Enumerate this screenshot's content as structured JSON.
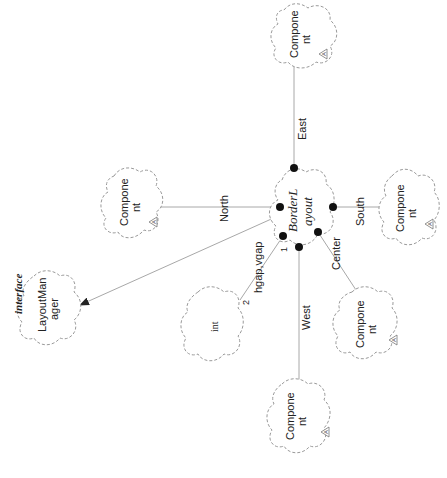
{
  "diagram": {
    "type": "UML class diagram (Booch cloud notation), rotated 90° counter-clockwise",
    "center_class": {
      "name_line1": "BorderL",
      "name_line2": "ayout"
    },
    "classes": [
      {
        "id": "component-east",
        "line1": "Compone",
        "line2": "nt",
        "abstract_marker": "A"
      },
      {
        "id": "component-north",
        "line1": "Compone",
        "line2": "nt",
        "abstract_marker": "A"
      },
      {
        "id": "component-south",
        "line1": "Compone",
        "line2": "nt",
        "abstract_marker": "A"
      },
      {
        "id": "component-center",
        "line1": "Compone",
        "line2": "nt",
        "abstract_marker": "A"
      },
      {
        "id": "component-west",
        "line1": "Compone",
        "line2": "nt",
        "abstract_marker": "A"
      },
      {
        "id": "int",
        "line1": "int"
      },
      {
        "id": "layout-manager",
        "stereotype": "interface",
        "line1": "LayoutMan",
        "line2": "ager"
      }
    ],
    "relations": [
      {
        "label": "East",
        "from": "BorderLayout",
        "to": "component-east",
        "kind": "has"
      },
      {
        "label": "North",
        "from": "BorderLayout",
        "to": "component-north",
        "kind": "has"
      },
      {
        "label": "South",
        "from": "BorderLayout",
        "to": "component-south",
        "kind": "has"
      },
      {
        "label": "Center",
        "from": "BorderLayout",
        "to": "component-center",
        "kind": "has"
      },
      {
        "label": "West",
        "from": "BorderLayout",
        "to": "component-west",
        "kind": "has"
      },
      {
        "label": "hgap,vgap",
        "from": "BorderLayout",
        "to": "int",
        "kind": "has",
        "source_multiplicity": "1",
        "target_multiplicity": "2"
      },
      {
        "label": "",
        "from": "BorderLayout",
        "to": "layout-manager",
        "kind": "realizes"
      }
    ]
  }
}
